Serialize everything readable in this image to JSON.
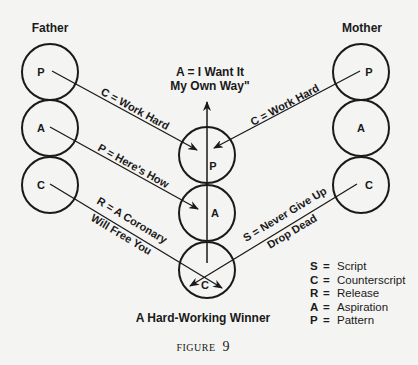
{
  "parents": {
    "father": {
      "label": "Father",
      "states": [
        "P",
        "A",
        "C"
      ]
    },
    "mother": {
      "label": "Mother",
      "states": [
        "P",
        "A",
        "C"
      ]
    }
  },
  "child": {
    "states": [
      "P",
      "A",
      "C"
    ],
    "caption": "A Hard-Working Winner",
    "aspiration": {
      "line1": "A = I Want It",
      "line2": "My Own Way\""
    }
  },
  "messages": {
    "father_p": "C = Work Hard",
    "father_a": "P = Here's How",
    "father_c_line1": "R = A Coronary",
    "father_c_line2": "Will Free You",
    "mother_p": "C = Work Hard",
    "mother_c_line1": "S = Never Give Up",
    "mother_c_line2": "Drop Dead"
  },
  "legend": [
    {
      "key": "S",
      "eq": "=",
      "value": "Script"
    },
    {
      "key": "C",
      "eq": "=",
      "value": "Counterscript"
    },
    {
      "key": "R",
      "eq": "=",
      "value": "Release"
    },
    {
      "key": "A",
      "eq": "=",
      "value": "Aspiration"
    },
    {
      "key": "P",
      "eq": "=",
      "value": "Pattern"
    }
  ],
  "figure": {
    "prefix": "FIGURE",
    "number": "9"
  }
}
